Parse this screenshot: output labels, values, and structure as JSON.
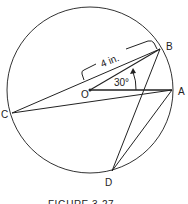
{
  "figure": {
    "caption": "FIGURE 3-27",
    "radius_label": "4 in.",
    "angle_label": "30°",
    "points": {
      "O": "O",
      "A": "A",
      "B": "B",
      "C": "C",
      "D": "D"
    }
  }
}
